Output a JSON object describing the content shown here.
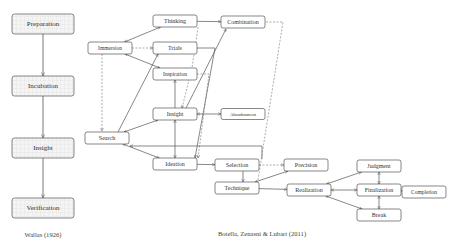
{
  "diagram": {
    "wallas": {
      "caption": "Wallas (1926)",
      "stages": [
        {
          "id": "preparation",
          "label": "Preparation"
        },
        {
          "id": "incubation",
          "label": "Incubation"
        },
        {
          "id": "insight_w",
          "label": "Insight"
        },
        {
          "id": "verification",
          "label": "Verification"
        }
      ],
      "edges": [
        {
          "from": "preparation",
          "to": "incubation"
        },
        {
          "from": "incubation",
          "to": "insight_w"
        },
        {
          "from": "insight_w",
          "to": "verification"
        }
      ]
    },
    "botella": {
      "caption": "Botella, Zenasni & Lubart (2011)",
      "nodes": [
        {
          "id": "thinking",
          "label": "Thinking"
        },
        {
          "id": "combination",
          "label": "Combination"
        },
        {
          "id": "immersion",
          "label": "Immersion"
        },
        {
          "id": "trials",
          "label": "Trials"
        },
        {
          "id": "inspiration",
          "label": "Inspiration"
        },
        {
          "id": "insight",
          "label": "Insight"
        },
        {
          "id": "abandonment",
          "label": "Abandonment"
        },
        {
          "id": "search",
          "label": "Search"
        },
        {
          "id": "ideation",
          "label": "Ideation"
        },
        {
          "id": "selection",
          "label": "Selection"
        },
        {
          "id": "precision",
          "label": "Precision"
        },
        {
          "id": "technique",
          "label": "Technique"
        },
        {
          "id": "realization",
          "label": "Realization"
        },
        {
          "id": "judgment",
          "label": "Judgment"
        },
        {
          "id": "finalization",
          "label": "Finalization"
        },
        {
          "id": "completion",
          "label": "Completion"
        },
        {
          "id": "break",
          "label": "Break"
        }
      ],
      "edges": [
        {
          "from": "immersion",
          "to": "thinking",
          "style": "solid",
          "direction": "both"
        },
        {
          "from": "thinking",
          "to": "combination",
          "style": "solid",
          "direction": "forward"
        },
        {
          "from": "immersion",
          "to": "trials",
          "style": "dashed",
          "direction": "forward"
        },
        {
          "from": "immersion",
          "to": "inspiration",
          "style": "solid",
          "direction": "both"
        },
        {
          "from": "immersion",
          "to": "search",
          "style": "dashed",
          "direction": "forward"
        },
        {
          "from": "search",
          "to": "trials",
          "style": "solid",
          "direction": "forward"
        },
        {
          "from": "search",
          "to": "insight",
          "style": "solid",
          "direction": "both"
        },
        {
          "from": "search",
          "to": "ideation",
          "style": "solid",
          "direction": "both"
        },
        {
          "from": "insight",
          "to": "inspiration",
          "style": "solid",
          "direction": "forward"
        },
        {
          "from": "insight",
          "to": "combination",
          "style": "solid",
          "direction": "forward"
        },
        {
          "from": "insight",
          "to": "abandonment",
          "style": "solid",
          "direction": "both"
        },
        {
          "from": "insight",
          "to": "ideation",
          "style": "solid",
          "direction": "both"
        },
        {
          "from": "trials",
          "to": "ideation",
          "style": "solid",
          "direction": "forward"
        },
        {
          "from": "inspiration",
          "to": "ideation",
          "style": "dashed",
          "direction": "forward"
        },
        {
          "from": "thinking",
          "to": "insight",
          "style": "dashed",
          "direction": "forward"
        },
        {
          "from": "ideation",
          "to": "selection",
          "style": "solid",
          "direction": "forward"
        },
        {
          "from": "selection",
          "to": "search",
          "style": "solid",
          "direction": "forward"
        },
        {
          "from": "selection",
          "to": "technique",
          "style": "solid",
          "direction": "forward"
        },
        {
          "from": "selection",
          "to": "precision",
          "style": "dashed",
          "direction": "forward"
        },
        {
          "from": "combination",
          "to": "technique",
          "style": "dashed",
          "direction": "forward"
        },
        {
          "from": "technique",
          "to": "precision",
          "style": "solid",
          "direction": "both"
        },
        {
          "from": "technique",
          "to": "realization",
          "style": "solid",
          "direction": "forward"
        },
        {
          "from": "realization",
          "to": "judgment",
          "style": "solid",
          "direction": "both"
        },
        {
          "from": "realization",
          "to": "finalization",
          "style": "solid",
          "direction": "both"
        },
        {
          "from": "realization",
          "to": "break",
          "style": "solid",
          "direction": "both"
        },
        {
          "from": "judgment",
          "to": "finalization",
          "style": "solid",
          "direction": "both"
        },
        {
          "from": "finalization",
          "to": "break",
          "style": "solid",
          "direction": "both"
        },
        {
          "from": "finalization",
          "to": "completion",
          "style": "solid",
          "direction": "forward"
        }
      ]
    }
  },
  "colors": {
    "stroke": "#555555",
    "text": "#333333",
    "box_fill": "#ffffff",
    "grid_fill": "#f3f3f3",
    "grid_line": "#e2e2e2"
  }
}
